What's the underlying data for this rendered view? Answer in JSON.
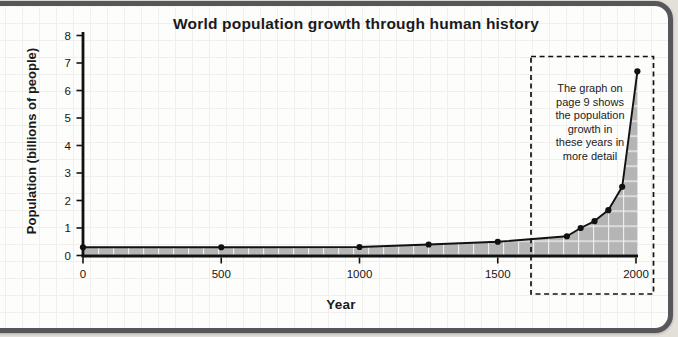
{
  "title": "World population growth through human history",
  "axes": {
    "y_label": "Population (billions of people)",
    "x_label": "Year",
    "y_ticks": [
      0,
      1,
      2,
      3,
      4,
      5,
      6,
      7,
      8
    ],
    "x_ticks": [
      0,
      500,
      1000,
      1500,
      2000
    ]
  },
  "annotation": {
    "lines": [
      "The graph on",
      "page 9 shows",
      "the population",
      "growth in",
      "these years in",
      "more detail"
    ]
  },
  "chart_data": {
    "type": "area",
    "title": "World population growth through human history",
    "xlabel": "Year",
    "ylabel": "Population (billions of people)",
    "x": [
      0,
      500,
      1000,
      1250,
      1500,
      1750,
      1800,
      1850,
      1900,
      1950,
      2005
    ],
    "values": [
      0.3,
      0.3,
      0.31,
      0.4,
      0.5,
      0.7,
      1.0,
      1.25,
      1.65,
      2.5,
      6.7
    ],
    "xlim": [
      0,
      2040
    ],
    "ylim": [
      0,
      8
    ],
    "x_ticks": [
      0,
      500,
      1000,
      1500,
      2000
    ],
    "y_ticks": [
      0,
      1,
      2,
      3,
      4,
      5,
      6,
      7,
      8
    ],
    "grid": "graph-paper background, white gridlines inside shaded area",
    "legend": "none",
    "markers": "filled black dots at each data point",
    "annotation_box": "dashed rectangle highlighting years ~1630-2040",
    "colors": {
      "area_fill": "#b5b5b5",
      "area_gridlines": "#ffffff",
      "line": "#111111",
      "axis": "#111111",
      "card_border": "#57575b",
      "paper": "#fdfdfc",
      "paper_grid": "#f1efed",
      "outer_background": "#e3e0da"
    }
  }
}
